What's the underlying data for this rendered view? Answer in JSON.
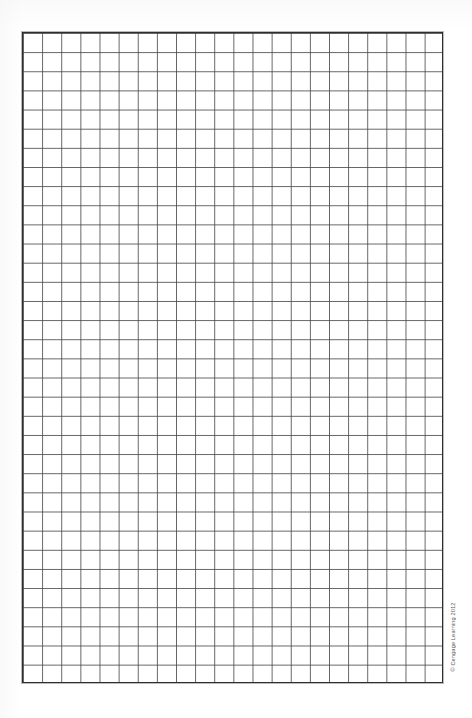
{
  "page": {
    "type": "blank-graph-paper-worksheet",
    "background_color": "#ffffff",
    "width_px": 472,
    "height_px": 718
  },
  "grid": {
    "name": "graph-paper-grid",
    "columns": 22,
    "rows": 34,
    "cell_width_px": 19.1,
    "cell_height_px": 19.1,
    "origin_x_px": 22,
    "origin_y_px": 32,
    "grid_width_px": 421,
    "grid_height_px": 651,
    "border_color": "#2e2e2e",
    "border_width_px": 1.6,
    "line_color": "#464646",
    "line_width_px": 0.9,
    "has_labels": false,
    "has_axis_numbers": false,
    "content": ""
  },
  "credit": {
    "text": "© Cengage Learning 2012",
    "orientation": "vertical-rotated-90",
    "color": "#4a4a4a"
  }
}
